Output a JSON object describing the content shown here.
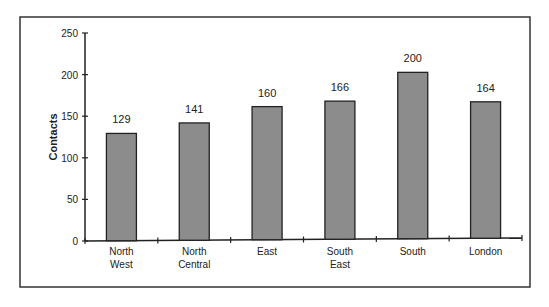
{
  "chart_data": {
    "type": "bar",
    "title": "",
    "xlabel": "",
    "ylabel": "Contacts",
    "ylim": [
      0,
      250
    ],
    "yticks": [
      0,
      50,
      100,
      150,
      200,
      250
    ],
    "grid": false,
    "legend": null,
    "categories": [
      "North West",
      "North Central",
      "East",
      "South East",
      "South",
      "London"
    ],
    "category_lines": [
      [
        "North",
        "West"
      ],
      [
        "North",
        "Central"
      ],
      [
        "East"
      ],
      [
        "South",
        "East"
      ],
      [
        "South"
      ],
      [
        "London"
      ]
    ],
    "values": [
      129,
      141,
      160,
      166,
      200,
      164
    ],
    "data_labels": [
      "129",
      "141",
      "160",
      "166",
      "200",
      "164"
    ],
    "bar_color": "#8c8c8c"
  }
}
